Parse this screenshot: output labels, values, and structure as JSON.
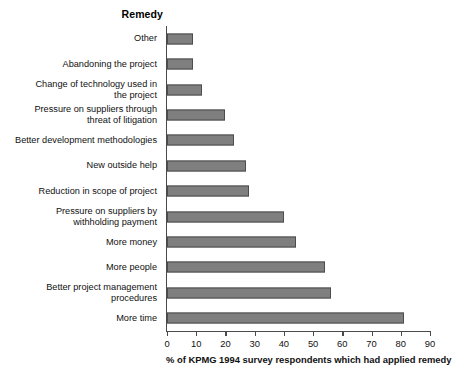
{
  "chart_data": {
    "type": "bar",
    "orientation": "horizontal",
    "title": "Remedy",
    "xlabel": "% of KPMG 1994 survey respondents which had applied remedy",
    "ylabel": "Remedy",
    "xlim": [
      0,
      90
    ],
    "xticks": [
      0,
      10,
      20,
      30,
      40,
      50,
      60,
      70,
      80,
      90
    ],
    "grid": false,
    "legend": null,
    "bar_color": "#7f7f7f",
    "bar_edge_color": "#4d4d4d",
    "categories": [
      "Other",
      "Abandoning the project",
      "Change of technology used in the project",
      "Pressure on suppliers through threat of litigation",
      "Better development methodologies",
      "New outside help",
      "Reduction in scope of project",
      "Pressure on suppliers by withholding payment",
      "More money",
      "More people",
      "Better project management procedures",
      "More time"
    ],
    "values": [
      9,
      9,
      12,
      20,
      23,
      27,
      28,
      40,
      44,
      54,
      56,
      81
    ],
    "points": [
      {
        "label": "Other",
        "label_lines": [
          "Other"
        ],
        "value": 9
      },
      {
        "label": "Abandoning the project",
        "label_lines": [
          "Abandoning the project"
        ],
        "value": 9
      },
      {
        "label": "Change of technology used in the project",
        "label_lines": [
          "Change of technology used in",
          "the project"
        ],
        "value": 12
      },
      {
        "label": "Pressure on suppliers through threat of litigation",
        "label_lines": [
          "Pressure on suppliers through",
          "threat of litigation"
        ],
        "value": 20
      },
      {
        "label": "Better development methodologies",
        "label_lines": [
          "Better development methodologies"
        ],
        "value": 23
      },
      {
        "label": "New outside help",
        "label_lines": [
          "New outside help"
        ],
        "value": 27
      },
      {
        "label": "Reduction in scope of project",
        "label_lines": [
          "Reduction in scope of project"
        ],
        "value": 28
      },
      {
        "label": "Pressure on suppliers by withholding payment",
        "label_lines": [
          "Pressure on suppliers by",
          "withholding payment"
        ],
        "value": 40
      },
      {
        "label": "More money",
        "label_lines": [
          "More money"
        ],
        "value": 44
      },
      {
        "label": "More people",
        "label_lines": [
          "More people"
        ],
        "value": 54
      },
      {
        "label": "Better project management procedures",
        "label_lines": [
          "Better project management",
          "procedures"
        ],
        "value": 56
      },
      {
        "label": "More time",
        "label_lines": [
          "More time"
        ],
        "value": 81
      }
    ]
  }
}
